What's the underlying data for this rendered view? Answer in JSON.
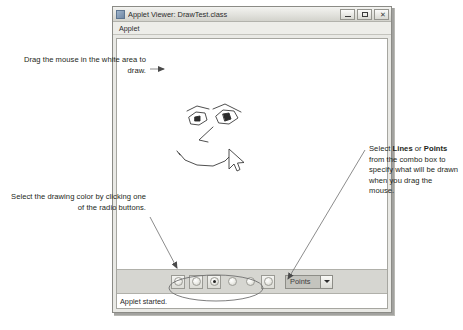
{
  "annotations": {
    "draw_note": "Drag the mouse in the white area to draw.",
    "color_note": "Select the drawing color by clicking one of the radio buttons.",
    "combo_note_pre": "Select ",
    "combo_note_b1": "Lines",
    "combo_note_mid": " or ",
    "combo_note_b2": "Points",
    "combo_note_post": " from the combo box to specify what will be drawn when you drag the mouse."
  },
  "window": {
    "title": "Applet Viewer: DrawTest.class",
    "icon": "applet-viewer-icon",
    "buttons": {
      "minimize": "minimize-icon",
      "maximize": "maximize-icon",
      "close": "close-icon"
    }
  },
  "menubar": {
    "items": [
      {
        "label": "Applet"
      }
    ]
  },
  "canvas": {
    "description": "hand drawn face: two eyes, nose, smile",
    "cursor": "mouse-pointer-icon"
  },
  "controls": {
    "radios": [
      {
        "name": "color-radio-1",
        "selected": false,
        "framed": true
      },
      {
        "name": "color-radio-2",
        "selected": false,
        "framed": true
      },
      {
        "name": "color-radio-3",
        "selected": true,
        "framed": true
      },
      {
        "name": "color-radio-4",
        "selected": false,
        "framed": false
      },
      {
        "name": "color-radio-5",
        "selected": false,
        "framed": false
      },
      {
        "name": "color-radio-6",
        "selected": false,
        "framed": true
      }
    ],
    "combo": {
      "value": "Points",
      "options": [
        "Lines",
        "Points"
      ],
      "arrow": "chevron-down-icon"
    }
  },
  "statusbar": {
    "text": "Applet started."
  },
  "colors": {
    "window_bg": "#e9e9e5",
    "panel_bg": "#d6d6d1",
    "canvas_bg": "#ffffff",
    "ink": "#231f20",
    "leader": "#8a8a8a"
  }
}
